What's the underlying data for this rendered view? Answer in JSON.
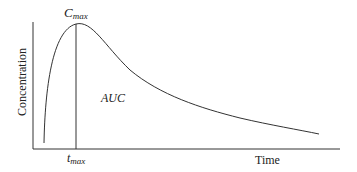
{
  "diagram": {
    "type": "pharmacokinetic concentration-time curve",
    "y_axis_label": "Concentration",
    "x_axis_label": "Time",
    "peak_label_main": "C",
    "peak_label_sub": "max",
    "time_label_main": "t",
    "time_label_sub": "max",
    "area_label": "AUC",
    "line_color": "#333333"
  }
}
